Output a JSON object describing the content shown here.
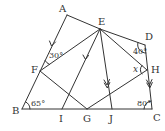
{
  "diagram": {
    "type": "geometry",
    "stroke_color": "#333333",
    "background": "#ffffff",
    "points": {
      "A": {
        "label": "A",
        "x": 67,
        "y": 15,
        "lx": 59,
        "ly": 12
      },
      "E": {
        "label": "E",
        "x": 100,
        "y": 29,
        "lx": 98,
        "ly": 25
      },
      "D": {
        "label": "D",
        "x": 145,
        "y": 45,
        "lx": 145,
        "ly": 40
      },
      "H": {
        "label": "H",
        "x": 147,
        "y": 70,
        "lx": 151,
        "ly": 73
      },
      "C": {
        "label": "C",
        "x": 152,
        "y": 109,
        "lx": 153,
        "ly": 121
      },
      "B": {
        "label": "B",
        "x": 22,
        "y": 109,
        "lx": 12,
        "ly": 114
      },
      "F": {
        "label": "F",
        "x": 40,
        "y": 71,
        "lx": 31,
        "ly": 73
      },
      "I": {
        "label": "I",
        "x": 62,
        "y": 109,
        "lx": 59,
        "ly": 122
      },
      "G": {
        "label": "G",
        "x": 87,
        "y": 109,
        "lx": 83,
        "ly": 122
      },
      "J": {
        "label": "J",
        "x": 112,
        "y": 109,
        "lx": 109,
        "ly": 122
      }
    },
    "segments": [
      [
        "A",
        "B"
      ],
      [
        "A",
        "E"
      ],
      [
        "E",
        "D"
      ],
      [
        "D",
        "C"
      ],
      [
        "B",
        "C"
      ],
      [
        "E",
        "F"
      ],
      [
        "F",
        "G"
      ],
      [
        "E",
        "I"
      ],
      [
        "E",
        "J"
      ],
      [
        "E",
        "H"
      ],
      [
        "H",
        "G"
      ]
    ],
    "angles": {
      "angle_AFE": {
        "text": "30°",
        "vertex": "F"
      },
      "angle_EDH": {
        "text": "40°",
        "vertex": "D"
      },
      "angle_EHG": {
        "text": "x",
        "vertex": "H"
      },
      "angle_ABC": {
        "text": "65°",
        "vertex": "B"
      },
      "angle_BCD": {
        "text": "80°",
        "vertex": "C"
      }
    },
    "parallel_marks": [
      {
        "segment": [
          "A",
          "B"
        ],
        "arrows": 1
      },
      {
        "segment": [
          "E",
          "I"
        ],
        "arrows": 1
      },
      {
        "segment": [
          "E",
          "J"
        ],
        "arrows": 2
      },
      {
        "segment": [
          "D",
          "C"
        ],
        "arrows": 2
      }
    ]
  }
}
